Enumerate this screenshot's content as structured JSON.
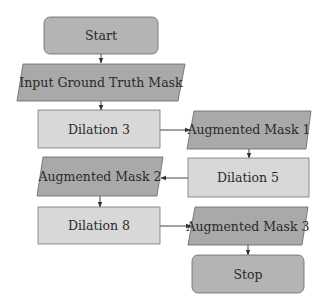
{
  "diagram": {
    "type": "flowchart",
    "colors": {
      "terminal_fill": "#b4b4b4",
      "io_fill": "#a9a9a9",
      "process_fill": "#d8d8d8",
      "stroke": "#555555",
      "text": "#2a2a2a"
    },
    "nodes": [
      {
        "id": "start",
        "shape": "rounded-rect",
        "label": "Start"
      },
      {
        "id": "input",
        "shape": "parallelogram",
        "label": "Input Ground Truth Mask"
      },
      {
        "id": "dil3",
        "shape": "rect",
        "label": "Dilation 3"
      },
      {
        "id": "aug1",
        "shape": "parallelogram",
        "label": "Augmented Mask 1"
      },
      {
        "id": "dil5",
        "shape": "rect",
        "label": "Dilation 5"
      },
      {
        "id": "aug2",
        "shape": "parallelogram",
        "label": "Augmented Mask 2"
      },
      {
        "id": "dil8",
        "shape": "rect",
        "label": "Dilation 8"
      },
      {
        "id": "aug3",
        "shape": "parallelogram",
        "label": "Augmented Mask 3"
      },
      {
        "id": "stop",
        "shape": "rounded-rect",
        "label": "Stop"
      }
    ],
    "edges": [
      {
        "from": "start",
        "to": "input"
      },
      {
        "from": "input",
        "to": "dil3"
      },
      {
        "from": "dil3",
        "to": "aug1"
      },
      {
        "from": "aug1",
        "to": "dil5"
      },
      {
        "from": "dil5",
        "to": "aug2"
      },
      {
        "from": "aug2",
        "to": "dil8"
      },
      {
        "from": "dil8",
        "to": "aug3"
      },
      {
        "from": "aug3",
        "to": "stop"
      }
    ]
  }
}
